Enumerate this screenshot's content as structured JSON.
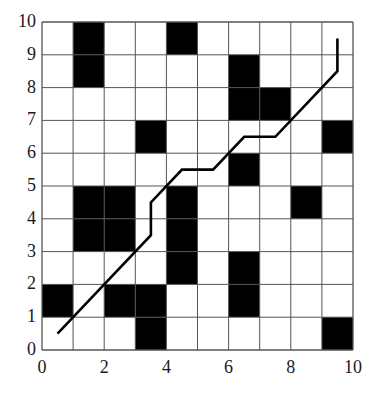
{
  "diagram": {
    "type": "grid-path",
    "grid": {
      "cols": 10,
      "rows": 10,
      "xmin": 0,
      "xmax": 10,
      "ymin": 0,
      "ymax": 10
    },
    "axes": {
      "x_ticks": [
        {
          "value": 0,
          "label": "0"
        },
        {
          "value": 2,
          "label": "2"
        },
        {
          "value": 4,
          "label": "4"
        },
        {
          "value": 6,
          "label": "6"
        },
        {
          "value": 8,
          "label": "8"
        },
        {
          "value": 10,
          "label": "10"
        }
      ],
      "y_ticks": [
        {
          "value": 0,
          "label": "0"
        },
        {
          "value": 1,
          "label": "1"
        },
        {
          "value": 2,
          "label": "2"
        },
        {
          "value": 3,
          "label": "3"
        },
        {
          "value": 4,
          "label": "4"
        },
        {
          "value": 5,
          "label": "5"
        },
        {
          "value": 6,
          "label": "6"
        },
        {
          "value": 7,
          "label": "7"
        },
        {
          "value": 8,
          "label": "8"
        },
        {
          "value": 9,
          "label": "9"
        },
        {
          "value": 10,
          "label": "10"
        }
      ]
    },
    "obstacles": [
      [
        1,
        9
      ],
      [
        1,
        8
      ],
      [
        4,
        9
      ],
      [
        6,
        8
      ],
      [
        6,
        7
      ],
      [
        7,
        7
      ],
      [
        3,
        6
      ],
      [
        9,
        6
      ],
      [
        6,
        5
      ],
      [
        1,
        4
      ],
      [
        2,
        4
      ],
      [
        1,
        3
      ],
      [
        2,
        3
      ],
      [
        4,
        4
      ],
      [
        4,
        3
      ],
      [
        4,
        2
      ],
      [
        8,
        4
      ],
      [
        6,
        2
      ],
      [
        6,
        1
      ],
      [
        0,
        1
      ],
      [
        2,
        1
      ],
      [
        3,
        1
      ],
      [
        3,
        0
      ],
      [
        9,
        0
      ]
    ],
    "path": [
      [
        0.5,
        0.5
      ],
      [
        3.5,
        3.5
      ],
      [
        3.5,
        4.5
      ],
      [
        4.5,
        5.5
      ],
      [
        5.5,
        5.5
      ],
      [
        6.5,
        6.5
      ],
      [
        7.5,
        6.5
      ],
      [
        9.5,
        8.5
      ],
      [
        9.5,
        9.5
      ]
    ],
    "colors": {
      "obstacle": "#000000",
      "grid_line": "#555555",
      "path": "#000000",
      "background": "#ffffff"
    }
  }
}
